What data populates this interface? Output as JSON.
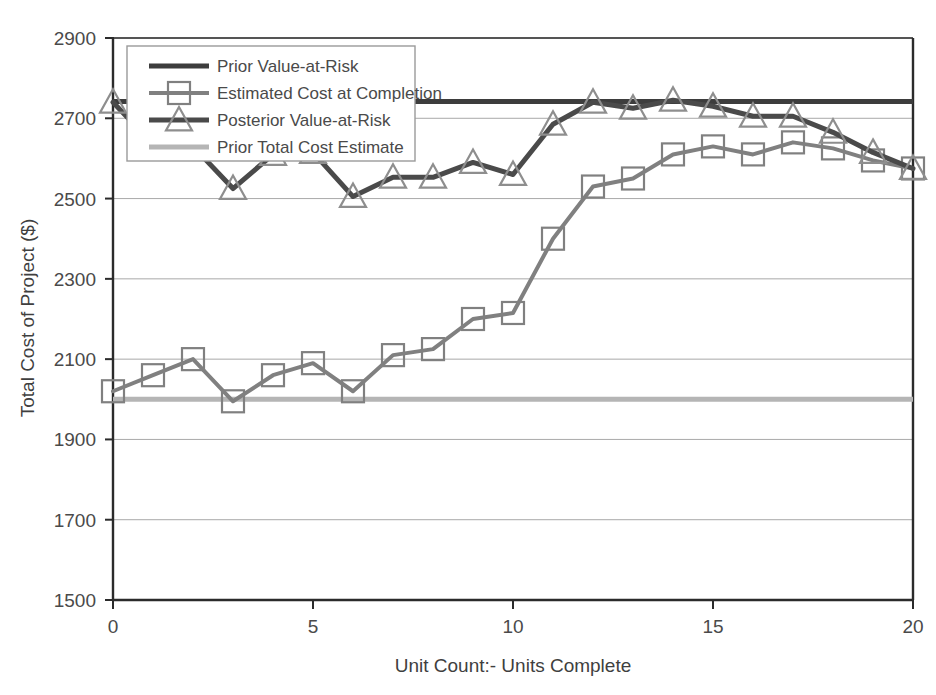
{
  "chart_data": {
    "type": "line",
    "title": "",
    "xlabel": "Unit Count:- Units Complete",
    "ylabel": "Total Cost of Project ($)",
    "xlim": [
      0,
      20
    ],
    "ylim": [
      1500,
      2900
    ],
    "xticks": [
      0,
      5,
      10,
      15,
      20
    ],
    "yticks": [
      1500,
      1700,
      1900,
      2100,
      2300,
      2500,
      2700,
      2900
    ],
    "grid": "horizontal",
    "legend_position": "top-left-inside",
    "x": [
      0,
      1,
      2,
      3,
      4,
      5,
      6,
      7,
      8,
      9,
      10,
      11,
      12,
      13,
      14,
      15,
      16,
      17,
      18,
      19,
      20
    ],
    "series": [
      {
        "name": "Prior Value-at-Risk",
        "type": "constant-line",
        "color": "#3d3d3d",
        "width": 5,
        "marker": "none",
        "value": 2742,
        "values": [
          2742,
          2742,
          2742,
          2742,
          2742,
          2742,
          2742,
          2742,
          2742,
          2742,
          2742,
          2742,
          2742,
          2742,
          2742,
          2742,
          2742,
          2742,
          2742,
          2742,
          2742
        ]
      },
      {
        "name": "Estimated Cost at Completion",
        "type": "line-marker",
        "color": "#808080",
        "width": 4,
        "marker": "square",
        "values": [
          2020,
          2060,
          2100,
          1995,
          2060,
          2090,
          2020,
          2110,
          2125,
          2200,
          2215,
          2400,
          2530,
          2550,
          2610,
          2630,
          2610,
          2640,
          2625,
          2595,
          2575
        ]
      },
      {
        "name": "Posterior Value-at-Risk",
        "type": "line-marker",
        "color": "#4a4a4a",
        "width": 5,
        "marker": "triangle",
        "values": [
          2740,
          2635,
          2630,
          2525,
          2610,
          2615,
          2505,
          2553,
          2553,
          2590,
          2560,
          2685,
          2740,
          2725,
          2745,
          2730,
          2705,
          2705,
          2665,
          2615,
          2575
        ]
      },
      {
        "name": "Prior Total Cost Estimate",
        "type": "constant-line",
        "color": "#b5b5b5",
        "width": 5,
        "marker": "none",
        "value": 2000,
        "values": [
          2000,
          2000,
          2000,
          2000,
          2000,
          2000,
          2000,
          2000,
          2000,
          2000,
          2000,
          2000,
          2000,
          2000,
          2000,
          2000,
          2000,
          2000,
          2000,
          2000,
          2000
        ]
      }
    ],
    "legend": [
      "Prior Value-at-Risk",
      "Estimated Cost at Completion",
      "Posterior Value-at-Risk",
      "Prior Total Cost Estimate"
    ],
    "colors": {
      "prior_var": "#3d3d3d",
      "estimated_cost": "#808080",
      "posterior_var": "#4a4a4a",
      "prior_total_cost": "#b5b5b5",
      "gridline": "#a9a9a9",
      "axis": "#2b2b2b",
      "background": "#ffffff"
    }
  }
}
